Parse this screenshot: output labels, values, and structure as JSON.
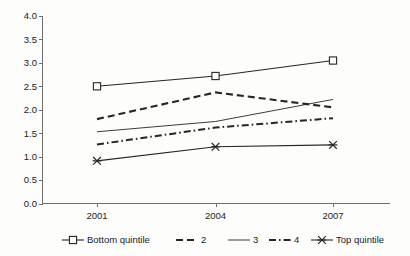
{
  "chart_data": {
    "type": "line",
    "title": "",
    "xlabel": "",
    "ylabel": "",
    "categories": [
      "2001",
      "2004",
      "2007"
    ],
    "x_tick_labels": [
      "2001",
      "2004",
      "2007"
    ],
    "y_tick_labels": [
      "0.0",
      "0.5",
      "1.0",
      "1.5",
      "2.0",
      "2.5",
      "3.0",
      "3.5",
      "4.0"
    ],
    "y_ticks": [
      0.0,
      0.5,
      1.0,
      1.5,
      2.0,
      2.5,
      3.0,
      3.5,
      4.0
    ],
    "ylim": [
      0.0,
      4.0
    ],
    "grid": false,
    "legend_position": "bottom",
    "series": [
      {
        "name": "Bottom quintile",
        "values": [
          2.5,
          2.72,
          3.05
        ],
        "line_style": "solid",
        "marker": "square-open",
        "color": "#262626"
      },
      {
        "name": "2",
        "values": [
          1.8,
          2.37,
          2.05
        ],
        "line_style": "dashed",
        "marker": "none",
        "color": "#262626"
      },
      {
        "name": "3",
        "values": [
          1.53,
          1.75,
          2.22
        ],
        "line_style": "solid-thin",
        "marker": "none",
        "color": "#262626"
      },
      {
        "name": "4",
        "values": [
          1.26,
          1.62,
          1.82
        ],
        "line_style": "dash-dot",
        "marker": "none",
        "color": "#262626"
      },
      {
        "name": "Top quintile",
        "values": [
          0.91,
          1.21,
          1.25
        ],
        "line_style": "solid",
        "marker": "cross",
        "color": "#262626"
      }
    ]
  },
  "legend": {
    "items": [
      {
        "label": "Bottom quintile"
      },
      {
        "label": "2"
      },
      {
        "label": "3"
      },
      {
        "label": "4"
      },
      {
        "label": "Top quintile"
      }
    ]
  },
  "axes": {
    "y_labels": [
      "4.0",
      "3.5",
      "3.0",
      "2.5",
      "2.0",
      "1.5",
      "1.0",
      "0.5",
      "0.0"
    ],
    "x_labels": [
      "2001",
      "2004",
      "2007"
    ]
  }
}
